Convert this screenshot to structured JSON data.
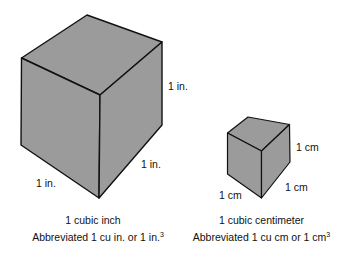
{
  "colors": {
    "cube_fill": "#9b9b9b",
    "edge": "#111111",
    "background": "#ffffff"
  },
  "large_cube": {
    "name": "cubic inch cube",
    "labels": {
      "right_edge": "1 in.",
      "front_right_edge": "1 in.",
      "front_left_edge": "1 in."
    },
    "caption": {
      "title": "1 cubic inch",
      "abbrev_prefix": "Abbreviated 1 cu in. or 1 in.",
      "abbrev_exponent": "3"
    }
  },
  "small_cube": {
    "name": "cubic centimeter cube",
    "labels": {
      "right_edge": "1 cm",
      "front_right_edge": "1 cm",
      "front_left_edge": "1 cm"
    },
    "caption": {
      "title": "1 cubic  centimeter",
      "abbrev_prefix": "Abbreviated 1 cu cm or 1 cm",
      "abbrev_exponent": "3"
    }
  }
}
